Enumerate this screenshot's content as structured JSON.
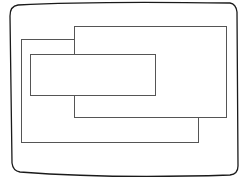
{
  "diagram": {
    "colors": {
      "background": "#ffffff",
      "screen_stroke": "#1a1a1a",
      "window_stroke": "#555555"
    },
    "screen": {
      "label": ""
    },
    "windows": [
      {
        "id": "window-back-left",
        "x": 21,
        "y": 39,
        "w": 177,
        "h": 103
      },
      {
        "id": "window-top-right",
        "x": 74,
        "y": 26,
        "w": 152,
        "h": 91
      },
      {
        "id": "window-front",
        "x": 30,
        "y": 54,
        "w": 125,
        "h": 41
      }
    ]
  }
}
